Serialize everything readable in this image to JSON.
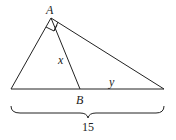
{
  "diagram": {
    "labels": {
      "vertex_a": "A",
      "point_b": "B",
      "segment_x": "x",
      "segment_y": "y",
      "base_length": "15"
    },
    "stroke_color": "#222222"
  }
}
